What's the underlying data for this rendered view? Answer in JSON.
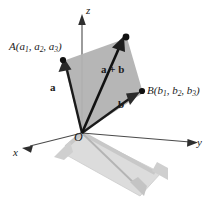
{
  "diagram": {
    "background_color": "#ffffff",
    "plane_fill": "#b2b2b2",
    "shadow_fill": "#dcdcdc",
    "shadow_stroke": "#c9c9c9",
    "shadow_arrow_color": "#c4c4c4",
    "vector_color": "#1a1a1a",
    "axis_color": "#3d3d3d",
    "axes": [
      {
        "name": "x",
        "label": "x"
      },
      {
        "name": "y",
        "label": "y"
      },
      {
        "name": "z",
        "label": "z"
      }
    ],
    "origin": {
      "label": "O"
    },
    "points": [
      {
        "name": "point-A",
        "label_prefix": "A(a",
        "label": "A(a1, a2, a3)",
        "coords": [
          "a",
          "a",
          "a"
        ],
        "subscripts": [
          "1",
          "2",
          "3"
        ]
      },
      {
        "name": "point-B",
        "label_prefix": "B(b",
        "label": "B(b1, b2, b3)",
        "coords": [
          "b",
          "b",
          "b"
        ],
        "subscripts": [
          "1",
          "2",
          "3"
        ]
      }
    ],
    "vectors": [
      {
        "name": "vector-a",
        "label": "a"
      },
      {
        "name": "vector-b",
        "label": "b"
      },
      {
        "name": "vector-a-plus-b",
        "label": "a + b"
      }
    ]
  }
}
